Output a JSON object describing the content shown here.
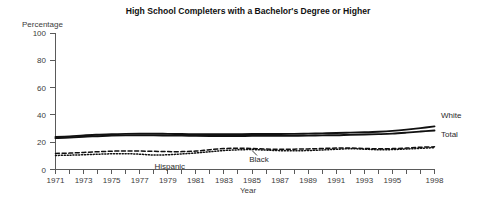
{
  "chart_data": {
    "type": "line",
    "title": "High School Completers with a Bachelor's Degree or Higher",
    "ylabel": "Percentage",
    "xlabel": "Year",
    "ylim": [
      0,
      100
    ],
    "yticks": [
      0,
      20,
      40,
      60,
      80,
      100
    ],
    "ytick_labels": [
      "0",
      "20",
      "40",
      "60",
      "80",
      "100"
    ],
    "xlim": [
      1971,
      1998
    ],
    "grid": false,
    "legend_position": "inline-right",
    "x": [
      1971,
      1972,
      1973,
      1974,
      1975,
      1976,
      1977,
      1978,
      1979,
      1980,
      1981,
      1982,
      1983,
      1984,
      1985,
      1986,
      1987,
      1988,
      1989,
      1990,
      1991,
      1992,
      1993,
      1994,
      1995,
      1996,
      1997,
      1998
    ],
    "xtick_labels": [
      "1971",
      "",
      "1973",
      "",
      "1975",
      "",
      "1977",
      "",
      "1979",
      "",
      "1981",
      "",
      "1983",
      "",
      "1985",
      "",
      "1987",
      "",
      "1989",
      "",
      "1991",
      "",
      "1993",
      "",
      "1995",
      "",
      "",
      "1998"
    ],
    "series": [
      {
        "name": "White",
        "style": "solid",
        "label": "White",
        "values": [
          23.8,
          24.3,
          25.0,
          25.5,
          25.9,
          26.1,
          26.2,
          26.2,
          26.1,
          26.0,
          25.9,
          25.8,
          25.8,
          25.9,
          26.0,
          26.0,
          26.0,
          26.1,
          26.3,
          26.5,
          26.7,
          27.0,
          27.3,
          27.7,
          28.3,
          29.2,
          30.3,
          31.6
        ]
      },
      {
        "name": "Total",
        "style": "solid",
        "label": "Total",
        "values": [
          23.0,
          23.4,
          24.0,
          24.4,
          24.8,
          25.0,
          25.0,
          25.0,
          24.9,
          24.8,
          24.6,
          24.5,
          24.5,
          24.5,
          24.6,
          24.6,
          24.6,
          24.7,
          24.8,
          25.0,
          25.1,
          25.4,
          25.6,
          25.9,
          26.3,
          27.0,
          27.8,
          28.6
        ]
      },
      {
        "name": "Black",
        "style": "dashed",
        "label": "Black",
        "values": [
          11.8,
          12.0,
          12.5,
          13.0,
          13.4,
          13.6,
          13.5,
          13.3,
          13.1,
          13.1,
          13.5,
          14.5,
          15.3,
          15.6,
          15.4,
          15.0,
          14.8,
          14.9,
          15.1,
          15.4,
          15.7,
          15.8,
          15.4,
          15.2,
          15.3,
          15.7,
          16.3,
          16.6
        ]
      },
      {
        "name": "Hispanic",
        "style": "dotted",
        "label": "Hispanic",
        "values": [
          10.3,
          10.5,
          10.8,
          11.2,
          11.5,
          11.6,
          11.2,
          10.6,
          10.8,
          11.4,
          12.1,
          13.0,
          13.9,
          14.4,
          14.6,
          14.2,
          13.8,
          13.7,
          13.9,
          14.3,
          14.8,
          15.2,
          14.9,
          14.5,
          14.6,
          15.0,
          15.5,
          16.0
        ]
      }
    ],
    "annotations": [
      {
        "text": "White",
        "series": "White"
      },
      {
        "text": "Total",
        "series": "Total"
      },
      {
        "text": "Black",
        "series": "Black"
      },
      {
        "text": "Hispanic",
        "series": "Hispanic"
      }
    ]
  }
}
